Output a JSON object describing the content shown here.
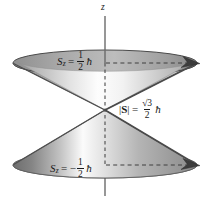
{
  "figure": {
    "background_color": "#ffffff",
    "axis": {
      "name": "z-axis",
      "label": "z",
      "color": "#555555"
    },
    "labels": {
      "spin_up": {
        "symbol": "S",
        "subscript": "z",
        "equals": "=",
        "sign": "",
        "numerator": "1",
        "denominator": "2",
        "unit": "ħ",
        "full_text": "S_z = 1/2 ħ"
      },
      "spin_down": {
        "symbol": "S",
        "subscript": "z",
        "equals": "=",
        "sign": "−",
        "numerator": "1",
        "denominator": "2",
        "unit": "ħ",
        "full_text": "S_z = −1/2 ħ"
      },
      "magnitude": {
        "bar_left": "|",
        "symbol": "S",
        "bar_right": "|",
        "equals": "=",
        "numerator": "√3",
        "denominator": "2",
        "unit": "ħ",
        "full_text": "|S| = (√3/2) ħ"
      }
    },
    "cones": {
      "upper": {
        "name": "upper-cone",
        "orientation": "opens-upward",
        "apex": [
          105,
          110
        ],
        "rim_center": [
          105,
          63
        ],
        "rim_rx": 92,
        "rim_ry": 13,
        "rim_edge_color": "#4a4a4a",
        "surface_light": "#fdfdfd",
        "surface_dark": "#8d8d8d"
      },
      "lower": {
        "name": "lower-cone",
        "orientation": "opens-downward",
        "apex": [
          105,
          110
        ],
        "rim_center": [
          105,
          165
        ],
        "rim_rx": 92,
        "rim_ry": 13,
        "rim_edge_color": "#4a4a4a",
        "surface_light": "#fbfbfb",
        "surface_dark": "#6e6e6e"
      }
    },
    "arrowheads": {
      "upper": {
        "name": "upper-spin-vector-arrowhead",
        "at": [
          197,
          63
        ]
      },
      "lower": {
        "name": "lower-spin-vector-arrowhead",
        "at": [
          197,
          165
        ]
      }
    },
    "dashed_lines": {
      "color": "#4a4a4a",
      "upper_level_y": 63,
      "lower_level_y": 165,
      "axis_x": 105
    }
  }
}
